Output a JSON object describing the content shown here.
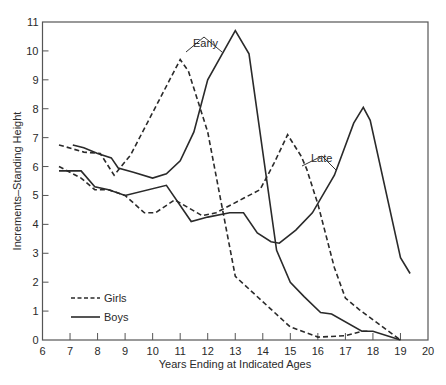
{
  "chart_data": {
    "type": "line",
    "title": "",
    "xlabel": "Years Ending at Indicated Ages",
    "ylabel": "Increments–Standing Height",
    "xlim": [
      6,
      20
    ],
    "ylim": [
      0,
      11
    ],
    "xticks": [
      6,
      7,
      8,
      9,
      10,
      11,
      12,
      13,
      14,
      15,
      16,
      17,
      18,
      19,
      20
    ],
    "yticks": [
      0,
      1,
      2,
      3,
      4,
      5,
      6,
      7,
      8,
      9,
      10,
      11
    ],
    "grid": false,
    "legend_position": "lower-left",
    "legend": [
      {
        "label": "Girls",
        "style": "dashed"
      },
      {
        "label": "Boys",
        "style": "solid"
      }
    ],
    "annotations": [
      {
        "text": "Early",
        "x": 12.3,
        "y": 10.1,
        "points_to": [
          "Early Girls peak",
          "Early Boys rise"
        ]
      },
      {
        "text": "Late",
        "x": 16.6,
        "y": 6.35,
        "points_to": [
          "Late Girls",
          "Late Boys"
        ]
      }
    ],
    "series": [
      {
        "name": "Girls (Early)",
        "style": "dashed",
        "x": [
          6.6,
          7.5,
          8.1,
          8.6,
          9.2,
          11.0,
          11.3,
          12.0,
          13.0,
          15.0,
          16.0,
          17.0,
          17.6,
          17.8
        ],
        "y": [
          6.75,
          6.5,
          6.45,
          5.7,
          6.4,
          9.7,
          9.3,
          7.2,
          2.2,
          0.45,
          0.1,
          0.15,
          0.3,
          0.3
        ]
      },
      {
        "name": "Boys (Early)",
        "style": "solid",
        "x": [
          7.1,
          7.5,
          8.0,
          8.5,
          8.75,
          9.3,
          10.0,
          10.5,
          11.0,
          11.5,
          12.0,
          13.0,
          13.5,
          14.5,
          15.0,
          15.5,
          16.1,
          16.5,
          17.6,
          18.0,
          19.0
        ],
        "y": [
          6.75,
          6.65,
          6.45,
          6.3,
          5.95,
          5.8,
          5.6,
          5.75,
          6.2,
          7.2,
          9.0,
          10.7,
          9.9,
          3.1,
          2.0,
          1.5,
          0.95,
          0.9,
          0.3,
          0.3,
          0.0
        ]
      },
      {
        "name": "Girls (Late)",
        "style": "dashed",
        "x": [
          6.6,
          7.4,
          7.9,
          8.4,
          9.0,
          9.7,
          10.1,
          10.8,
          11.8,
          12.3,
          13.3,
          13.9,
          14.4,
          14.9,
          15.4,
          15.6,
          16.0,
          16.6,
          17.0,
          17.5,
          19.0
        ],
        "y": [
          6.0,
          5.6,
          5.2,
          5.2,
          5.0,
          4.4,
          4.4,
          4.85,
          4.3,
          4.4,
          4.9,
          5.2,
          6.1,
          7.1,
          6.35,
          5.9,
          4.7,
          2.5,
          1.45,
          1.05,
          0.0
        ]
      },
      {
        "name": "Boys (Late)",
        "style": "solid",
        "x": [
          6.6,
          7.4,
          7.9,
          8.4,
          9.0,
          10.5,
          11.4,
          12.0,
          12.8,
          13.3,
          13.8,
          14.3,
          14.6,
          15.2,
          15.8,
          16.6,
          17.3,
          17.65,
          17.9,
          19.0,
          19.35
        ],
        "y": [
          5.85,
          5.85,
          5.3,
          5.2,
          5.0,
          5.35,
          4.1,
          4.25,
          4.4,
          4.4,
          3.7,
          3.4,
          3.35,
          3.8,
          4.4,
          5.7,
          7.5,
          8.05,
          7.6,
          2.85,
          2.3
        ]
      }
    ]
  }
}
